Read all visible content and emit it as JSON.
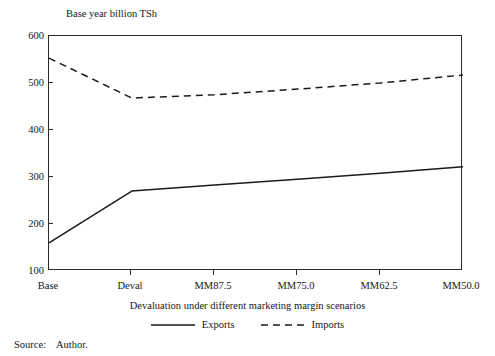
{
  "figure": {
    "y_axis_title": "Base year billion TSh",
    "x_axis_title": "Devaluation under different marketing margin scenarios",
    "source_label": "Source:",
    "source_value": "Author.",
    "source_text": "Source:    Author."
  },
  "legend": {
    "position": "bottom-center",
    "entries": [
      {
        "name": "Exports",
        "style": "solid",
        "color": "#1a1a1a"
      },
      {
        "name": "Imports",
        "style": "dashed",
        "color": "#1a1a1a"
      }
    ]
  },
  "axes": {
    "y_ticks": [
      "600",
      "500",
      "400",
      "300",
      "200",
      "100"
    ],
    "x_ticks": [
      "Base",
      "Deval",
      "MM87.5",
      "MM75.0",
      "MM62.5",
      "MM50.0"
    ]
  },
  "chart_data": {
    "type": "line",
    "title": "",
    "xlabel": "Devaluation under different marketing margin scenarios",
    "ylabel": "Base year billion TSh",
    "categories": [
      "Base",
      "Deval",
      "MM87.5",
      "MM75.0",
      "MM62.5",
      "MM50.0"
    ],
    "ylim": [
      100,
      600
    ],
    "ytick_step": 100,
    "grid": false,
    "legend_position": "bottom-center",
    "series": [
      {
        "name": "Exports",
        "style": "solid",
        "color": "#1a1a1a",
        "values": [
          160,
          270,
          283,
          295,
          308,
          322
        ]
      },
      {
        "name": "Imports",
        "style": "dashed",
        "color": "#1a1a1a",
        "values": [
          553,
          468,
          475,
          487,
          500,
          517
        ]
      }
    ]
  }
}
